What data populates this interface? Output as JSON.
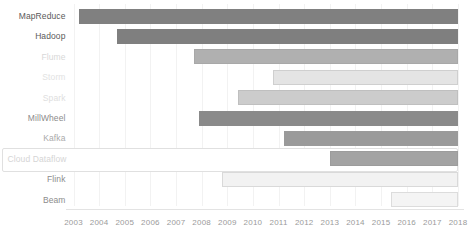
{
  "chart_data": {
    "type": "bar",
    "orientation": "horizontal",
    "subtype": "gantt-timeline",
    "title": "",
    "subtitle": "",
    "xlabel": "",
    "ylabel": "",
    "xlim": [
      2003,
      2018
    ],
    "grid": true,
    "legend": null,
    "tick_labels": [
      "2003",
      "2004",
      "2005",
      "2006",
      "2007",
      "2008",
      "2009",
      "2010",
      "2011",
      "2012",
      "2013",
      "2014",
      "2015",
      "2016",
      "2017",
      "2018"
    ],
    "categories": [
      "MapReduce",
      "Hadoop",
      "Flume",
      "Storm",
      "Spark",
      "MillWheel",
      "Kafka",
      "Cloud Dataflow",
      "Flink",
      "Beam"
    ],
    "bars": [
      {
        "label": "MapReduce",
        "start": 2003.2,
        "end": 2018.0,
        "color": "#808080",
        "border": "#808080",
        "label_color": "#595959",
        "dimmed": false,
        "highlighted": false
      },
      {
        "label": "Hadoop",
        "start": 2004.7,
        "end": 2018.0,
        "color": "#7f7f7f",
        "border": "#7f7f7f",
        "label_color": "#595959",
        "dimmed": false,
        "highlighted": false
      },
      {
        "label": "Flume",
        "start": 2007.7,
        "end": 2018.0,
        "color": "#b0b0b0",
        "border": "#a8a8a8",
        "label_color": "#d8d8d8",
        "dimmed": true,
        "highlighted": false
      },
      {
        "label": "Storm",
        "start": 2010.8,
        "end": 2018.0,
        "color": "#e4e4e4",
        "border": "#cfcfcf",
        "label_color": "#e2e2e2",
        "dimmed": true,
        "highlighted": false
      },
      {
        "label": "Spark",
        "start": 2009.4,
        "end": 2018.0,
        "color": "#cccccc",
        "border": "#bfbfbf",
        "label_color": "#dedede",
        "dimmed": true,
        "highlighted": false
      },
      {
        "label": "MillWheel",
        "start": 2007.9,
        "end": 2018.0,
        "color": "#8a8a8a",
        "border": "#8a8a8a",
        "label_color": "#8c8c8c",
        "dimmed": false,
        "highlighted": false
      },
      {
        "label": "Kafka",
        "start": 2011.2,
        "end": 2018.0,
        "color": "#9a9a9a",
        "border": "#9a9a9a",
        "label_color": "#aaaaaa",
        "dimmed": false,
        "highlighted": false
      },
      {
        "label": "Cloud Dataflow",
        "start": 2013.0,
        "end": 2018.0,
        "color": "#a3a3a3",
        "border": "#9c9c9c",
        "label_color": "#d5d5d5",
        "dimmed": true,
        "highlighted": true
      },
      {
        "label": "Flink",
        "start": 2008.8,
        "end": 2018.0,
        "color": "#f2f2f2",
        "border": "#d9d9d9",
        "label_color": "#8c8c8c",
        "dimmed": false,
        "highlighted": false
      },
      {
        "label": "Beam",
        "start": 2015.4,
        "end": 2018.0,
        "color": "#f4f4f4",
        "border": "#dcdcdc",
        "label_color": "#8c8c8c",
        "dimmed": false,
        "highlighted": false
      }
    ]
  },
  "colors": {
    "background": "#ffffff",
    "gridline": "#f2f2f2",
    "axis": "#e3e3e3",
    "tick_text": "#9b9b9b",
    "highlight_border": "#e0e0e0"
  }
}
